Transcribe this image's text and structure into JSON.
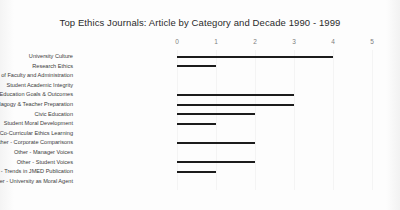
{
  "chart_data": {
    "type": "bar",
    "orientation": "horizontal",
    "title": "Top Ethics Journals: Article by Category and Decade 1990 - 1999",
    "xlabel": "",
    "ylabel": "",
    "xlim": [
      0,
      5
    ],
    "xticks": [
      0,
      1,
      2,
      3,
      4,
      5
    ],
    "xtick_labels": [
      "0",
      "1",
      "2",
      "3",
      "4",
      "5"
    ],
    "grid": true,
    "legend": null,
    "bar_color": "#1c1c1c",
    "categories": [
      "University Culture",
      "Research Ethics",
      "Ethical Responsibility of Faculty and Administration",
      "Student Academic Integrity",
      "Ethics Education Goals & Outcomes",
      "Ethics Pedagogy & Teacher Preparation",
      "Civic Education",
      "Student Moral Development",
      "Co-Curricular Ethics Learning",
      "Other - Corporate Comparisons",
      "Other - Manager Voices",
      "Other - Student Voices",
      "Other - Trends in JMED Publication",
      "Other - University as Moral Agent"
    ],
    "values": [
      4,
      1,
      0,
      0,
      3,
      3,
      2,
      1,
      0,
      2,
      0,
      2,
      1,
      0
    ]
  }
}
